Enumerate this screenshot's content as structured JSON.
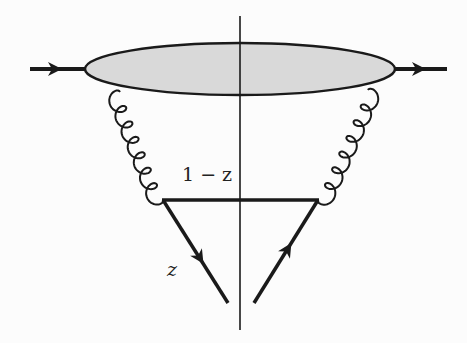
{
  "diagram": {
    "type": "cut Feynman diagram",
    "labels": {
      "upper_momentum_fraction": "1 − z",
      "lower_momentum_fraction": "z"
    },
    "elements": {
      "blob": "shaded ellipse (hadronic blob)",
      "incoming_line": "quark line with arrow into blob",
      "outgoing_line": "quark line with arrow out of blob",
      "left_gluon": "gluon from blob to vertex",
      "right_gluon": "gluon from blob to vertex",
      "cut_line": "vertical unitarity cut",
      "lower_left_quark": "quark line with arrow pointing down",
      "lower_right_quark": "quark line with arrow pointing up"
    },
    "colors": {
      "blob_fill": "#d9d9d9",
      "stroke": "#1a1a1a",
      "background": "#fcfcfc"
    }
  }
}
